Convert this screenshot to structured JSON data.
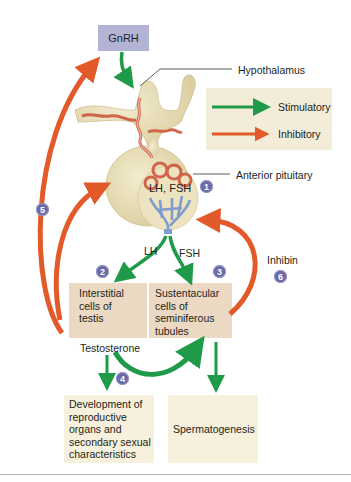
{
  "diagram": {
    "nodes": {
      "gnrh": "GnRH",
      "hypothalamus": "Hypothalamus",
      "anterior_pituitary": "Anterior pituitary",
      "pituitary_hormones": "LH, FSH",
      "lh": "LH",
      "fsh": "FSH",
      "interstitial_cells": [
        "Interstitial",
        "cells of",
        "testis"
      ],
      "sustentacular_cells": [
        "Sustentacular",
        "cells of",
        "seminiferous",
        "tubules"
      ],
      "testosterone": "Testosterone",
      "inhibin": "Inhibin",
      "development": [
        "Development of",
        "reproductive",
        "organs and",
        "secondary sexual",
        "characteristics"
      ],
      "spermatogenesis": "Spermatogenesis"
    },
    "legend": {
      "stimulatory": "Stimulatory",
      "inhibitory": "Inhibitory"
    },
    "badges": [
      "1",
      "2",
      "3",
      "4",
      "5",
      "6"
    ],
    "colors": {
      "stimulatory": "#1f9a48",
      "inhibitory": "#e2592a",
      "gnrh_box": "#b3b3d6",
      "cell_box": "#ecd9c3",
      "outcome_box": "#f6f0dc",
      "legend_box": "#f3ecd9",
      "badge": "#6a6aa6",
      "gland": "#e8dfb8",
      "vessel_red": "#d0654a",
      "vessel_blue": "#7f9ccf"
    },
    "arrows": [
      {
        "from": "GnRH",
        "to": "Hypothalamus/pituitary portal",
        "type": "stimulatory"
      },
      {
        "from": "Anterior pituitary",
        "to": "Interstitial cells of testis",
        "label": "LH",
        "type": "stimulatory"
      },
      {
        "from": "Anterior pituitary",
        "to": "Sustentacular cells of seminiferous tubules",
        "label": "FSH",
        "type": "stimulatory"
      },
      {
        "from": "Testosterone",
        "to": "Development of reproductive organs and secondary sexual characteristics",
        "type": "stimulatory"
      },
      {
        "from": "Testosterone",
        "to": "Sustentacular cells of seminiferous tubules",
        "type": "stimulatory"
      },
      {
        "from": "Sustentacular cells of seminiferous tubules",
        "to": "Spermatogenesis",
        "type": "stimulatory"
      },
      {
        "from": "Testosterone",
        "to": "GnRH",
        "type": "inhibitory",
        "badge": "5"
      },
      {
        "from": "Testosterone",
        "to": "Anterior pituitary",
        "type": "inhibitory",
        "badge": "5"
      },
      {
        "from": "Inhibin",
        "to": "Anterior pituitary",
        "type": "inhibitory",
        "badge": "6"
      }
    ]
  }
}
